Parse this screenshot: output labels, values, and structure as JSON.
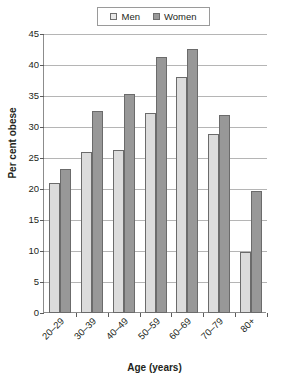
{
  "chart_data": {
    "type": "bar",
    "title": "",
    "xlabel": "Age (years)",
    "ylabel": "Per cent obese",
    "categories": [
      "20–29",
      "30–39",
      "40–49",
      "50–59",
      "60–69",
      "70–79",
      "80+"
    ],
    "series": [
      {
        "name": "Men",
        "values": [
          21.0,
          26.0,
          26.3,
          32.2,
          38.1,
          28.9,
          9.8
        ],
        "color": "#dcdcdc"
      },
      {
        "name": "Women",
        "values": [
          23.3,
          32.6,
          35.4,
          41.3,
          42.6,
          31.9,
          19.6
        ],
        "color": "#989898"
      }
    ],
    "ylim": [
      0,
      45
    ],
    "yticks": [
      0,
      5,
      10,
      15,
      20,
      25,
      30,
      35,
      40,
      45
    ],
    "ytick_labels": [
      "0",
      "5",
      "10",
      "15",
      "20",
      "25",
      "30",
      "35",
      "40",
      "45"
    ],
    "grid": true,
    "grid_axis": "y",
    "legend_position": "top-center",
    "legend_entries": [
      "Men",
      "Women"
    ]
  },
  "legend": {
    "items": [
      {
        "label": "Men",
        "swatch": "legend-swatch-men"
      },
      {
        "label": "Women",
        "swatch": "legend-swatch-women"
      }
    ]
  },
  "axes": {
    "y_title": "Per cent obese",
    "x_title": "Age (years)"
  }
}
